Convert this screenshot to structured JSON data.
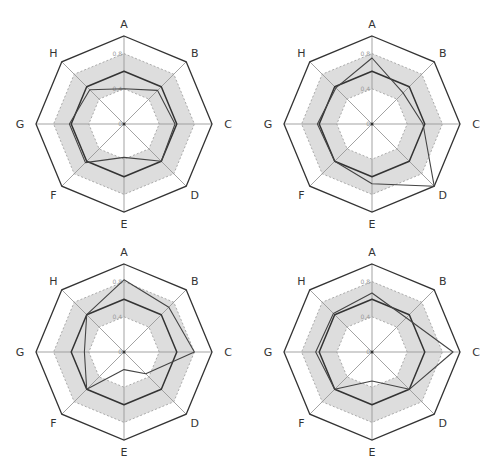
{
  "colors": {
    "frame": "#333333",
    "spoke": "#999999",
    "band_fill": "#dddddd",
    "ring_dash": "#999999",
    "series_primary": "#333333",
    "series_secondary": "#444444"
  },
  "chart_data": [
    {
      "type": "radar",
      "title": "",
      "axes": [
        "A",
        "B",
        "C",
        "D",
        "E",
        "F",
        "G",
        "H"
      ],
      "rlim": [
        0,
        1
      ],
      "ticks": [
        0,
        0.4,
        0.8
      ],
      "tick_labels": [
        "0",
        "0.4",
        "0.8"
      ],
      "band": [
        0.4,
        0.8
      ],
      "series": [
        {
          "name": "series-1",
          "values": [
            0.6,
            0.6,
            0.6,
            0.6,
            0.6,
            0.6,
            0.6,
            0.6
          ]
        },
        {
          "name": "series-2",
          "values": [
            0.4,
            0.54,
            0.58,
            0.6,
            0.38,
            0.62,
            0.62,
            0.55
          ]
        }
      ]
    },
    {
      "type": "radar",
      "title": "",
      "axes": [
        "A",
        "B",
        "C",
        "D",
        "E",
        "F",
        "G",
        "H"
      ],
      "rlim": [
        0,
        1
      ],
      "ticks": [
        0,
        0.4,
        0.8
      ],
      "tick_labels": [
        "0",
        "0.4",
        "0.8"
      ],
      "band": [
        0.4,
        0.8
      ],
      "series": [
        {
          "name": "series-1",
          "values": [
            0.6,
            0.6,
            0.6,
            0.6,
            0.6,
            0.6,
            0.6,
            0.6
          ]
        },
        {
          "name": "series-2",
          "values": [
            0.75,
            0.5,
            0.58,
            1.0,
            0.68,
            0.6,
            0.62,
            0.58
          ]
        }
      ]
    },
    {
      "type": "radar",
      "title": "",
      "axes": [
        "A",
        "B",
        "C",
        "D",
        "E",
        "F",
        "G",
        "H"
      ],
      "rlim": [
        0,
        1
      ],
      "ticks": [
        0,
        0.4,
        0.8
      ],
      "tick_labels": [
        "0",
        "0.4",
        "0.8"
      ],
      "band": [
        0.4,
        0.8
      ],
      "series": [
        {
          "name": "series-1",
          "values": [
            0.6,
            0.6,
            0.6,
            0.6,
            0.6,
            0.6,
            0.6,
            0.6
          ]
        },
        {
          "name": "series-2",
          "values": [
            0.82,
            0.72,
            0.8,
            0.35,
            0.2,
            0.6,
            0.45,
            0.6
          ]
        }
      ]
    },
    {
      "type": "radar",
      "title": "",
      "axes": [
        "A",
        "B",
        "C",
        "D",
        "E",
        "F",
        "G",
        "H"
      ],
      "rlim": [
        0,
        1
      ],
      "ticks": [
        0,
        0.4,
        0.8
      ],
      "tick_labels": [
        "0",
        "0.4",
        "0.8"
      ],
      "band": [
        0.4,
        0.8
      ],
      "series": [
        {
          "name": "series-1",
          "values": [
            0.6,
            0.6,
            0.6,
            0.6,
            0.6,
            0.6,
            0.6,
            0.6
          ]
        },
        {
          "name": "series-2",
          "values": [
            0.67,
            0.55,
            0.92,
            0.6,
            0.33,
            0.6,
            0.64,
            0.62
          ]
        }
      ]
    }
  ]
}
